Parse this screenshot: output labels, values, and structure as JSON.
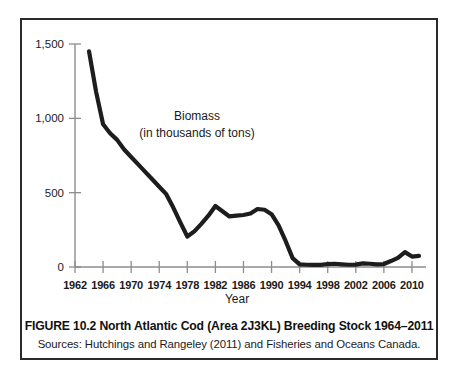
{
  "figure": {
    "caption_title": "FIGURE 10.2 North Atlantic Cod (Area 2J3KL) Breeding Stock 1964–2011",
    "caption_sources": "Sources: Hutchings and Rangeley (2011) and Fisheries and Oceans Canada.",
    "frame_color": "#2b2b2b",
    "background": "#ffffff"
  },
  "chart_data": {
    "type": "line",
    "title": "",
    "annotation_line1": "Biomass",
    "annotation_line2": "(in thousands of tons)",
    "xlabel": "Year",
    "ylabel": "",
    "xlim": [
      1962,
      2012
    ],
    "ylim": [
      0,
      1500
    ],
    "yticks": [
      0,
      500,
      1000,
      1500
    ],
    "ytick_labels": [
      "0",
      "500",
      "1,000",
      "1,500"
    ],
    "xticks": [
      1962,
      1966,
      1970,
      1974,
      1978,
      1982,
      1986,
      1990,
      1994,
      1998,
      2002,
      2006,
      2010
    ],
    "xtick_labels": [
      "1962",
      "1966",
      "1970",
      "1974",
      "1978",
      "1982",
      "1986",
      "1990",
      "1994",
      "1998",
      "2002",
      "2006",
      "2010"
    ],
    "grid": false,
    "legend": false,
    "line_color": "#1d1d1d",
    "axis_color": "#8d8d8d",
    "series": [
      {
        "name": "Breeding stock biomass",
        "x": [
          1964,
          1965,
          1966,
          1967,
          1968,
          1969,
          1970,
          1971,
          1972,
          1973,
          1974,
          1975,
          1976,
          1977,
          1978,
          1979,
          1980,
          1981,
          1982,
          1983,
          1984,
          1985,
          1986,
          1987,
          1988,
          1989,
          1990,
          1991,
          1992,
          1993,
          1994,
          1995,
          1996,
          1997,
          1998,
          1999,
          2000,
          2001,
          2002,
          2003,
          2004,
          2005,
          2006,
          2007,
          2008,
          2009,
          2010,
          2011
        ],
        "values": [
          1450,
          1180,
          960,
          900,
          855,
          790,
          740,
          690,
          640,
          590,
          540,
          490,
          400,
          300,
          205,
          240,
          290,
          345,
          410,
          375,
          340,
          345,
          350,
          360,
          390,
          385,
          355,
          280,
          175,
          60,
          18,
          15,
          14,
          14,
          20,
          22,
          18,
          15,
          16,
          24,
          22,
          18,
          20,
          40,
          62,
          100,
          70,
          75
        ]
      }
    ]
  }
}
